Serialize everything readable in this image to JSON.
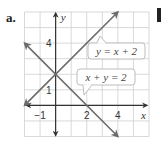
{
  "part_label": "a.",
  "chart_data": {
    "type": "line",
    "title": "",
    "xlabel": "x",
    "ylabel": "y",
    "xlim": [
      -2,
      6
    ],
    "ylim": [
      -2,
      6
    ],
    "grid": true,
    "x_tick_labels": [
      "−1",
      "2",
      "4"
    ],
    "x_tick_values": [
      -1,
      2,
      4
    ],
    "y_tick_labels": [
      "1",
      "4"
    ],
    "y_tick_values": [
      1,
      4
    ],
    "series": [
      {
        "name": "y = x + 2",
        "equation": "y = x + 2",
        "points": [
          [
            -2,
            0
          ],
          [
            4,
            6
          ]
        ],
        "arrows": "both",
        "color": "#6b6b6b"
      },
      {
        "name": "x + y = 2",
        "equation": "x + y = 2",
        "points": [
          [
            -2,
            4
          ],
          [
            4,
            -2
          ]
        ],
        "arrows": "both",
        "color": "#6b6b6b"
      }
    ],
    "intersection": [
      0,
      2
    ],
    "annotations": [
      {
        "text": "y = x + 2",
        "type": "callout",
        "points_to": "y = x + 2"
      },
      {
        "text": "x + y = 2",
        "type": "callout",
        "points_to": "x + y = 2"
      }
    ]
  },
  "colors": {
    "grid": "#cfcfcf",
    "axis": "#333333",
    "line": "#6b6b6b",
    "callout_border": "#b5b5b5"
  }
}
